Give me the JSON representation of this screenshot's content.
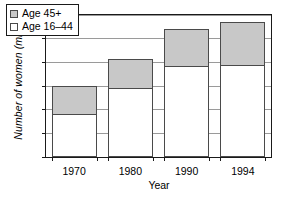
{
  "chart_data": {
    "type": "bar",
    "stacked": true,
    "title": "",
    "xlabel": "Year",
    "ylabel": "Number of women (millions)",
    "categories": [
      "1970",
      "1980",
      "1990",
      "1994"
    ],
    "series": [
      {
        "name": "Age 16–44",
        "color": "#ffffff",
        "values": [
          18,
          29,
          38.5,
          39
        ]
      },
      {
        "name": "Age 45+",
        "color": "#c8c8c8",
        "values": [
          12,
          12.5,
          15.5,
          18
        ]
      }
    ],
    "totals": [
      30,
      41.5,
      54,
      57
    ],
    "ylim": [
      0,
      60
    ],
    "ytick_values": [
      0,
      10,
      20,
      30,
      40,
      50,
      60
    ],
    "ytick_labels": [
      "0",
      "10",
      "20",
      "30",
      "40",
      "50",
      "60"
    ],
    "grid": true,
    "legend_position": "upper-left-inside",
    "legend_entries": [
      "Age 45+",
      "Age 16–44"
    ]
  }
}
